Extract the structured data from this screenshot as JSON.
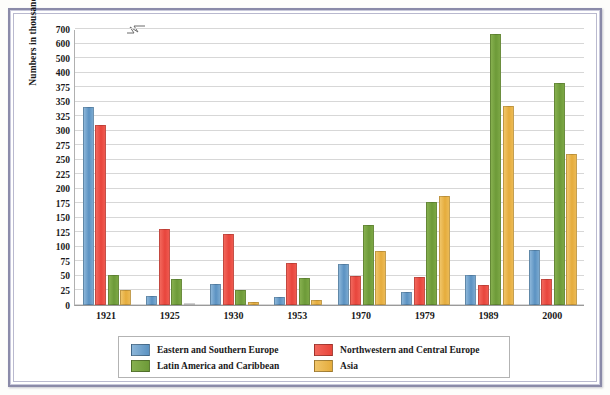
{
  "chart_data": {
    "type": "bar",
    "title": "",
    "xlabel": "",
    "ylabel": "Numbers in thousands",
    "categories": [
      "1921",
      "1925",
      "1930",
      "1953",
      "1970",
      "1979",
      "1989",
      "2000"
    ],
    "series": [
      {
        "name": "Eastern and Southern Europe",
        "color": "#5b92c2",
        "values": [
          340,
          16,
          36,
          14,
          70,
          23,
          52,
          94
        ]
      },
      {
        "name": "Northwestern and Central Europe",
        "color": "#e8453c",
        "values": [
          310,
          130,
          122,
          72,
          50,
          48,
          34,
          44
        ]
      },
      {
        "name": "Latin America and Caribbean",
        "color": "#6d9a38",
        "values": [
          51,
          45,
          26,
          47,
          137,
          177,
          667,
          382
        ]
      },
      {
        "name": "Asia",
        "color": "#e5ac3c",
        "values": [
          26,
          3,
          5,
          9,
          93,
          187,
          342,
          260
        ]
      }
    ],
    "ytick_labels": [
      "0",
      "25",
      "50",
      "75",
      "100",
      "125",
      "150",
      "175",
      "200",
      "225",
      "250",
      "275",
      "300",
      "325",
      "350",
      "375",
      "400",
      "500",
      "600",
      "700"
    ],
    "ylim": [
      0,
      700
    ],
    "axis_break": {
      "between": [
        400,
        500
      ],
      "present": true
    },
    "grid": true,
    "legend_position": "bottom"
  },
  "legend": {
    "entries": [
      {
        "label": "Eastern and Southern Europe"
      },
      {
        "label": "Northwestern and Central Europe"
      },
      {
        "label": "Latin America and Caribbean"
      },
      {
        "label": "Asia"
      }
    ]
  }
}
